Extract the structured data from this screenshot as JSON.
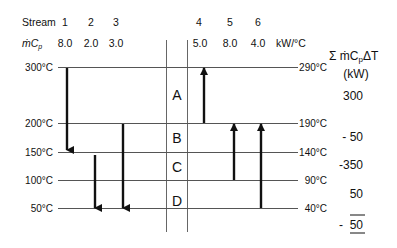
{
  "header": {
    "stream_label": "Stream",
    "mcp_label": "ṁC",
    "mcp_sub": "p",
    "units": "kW/°C",
    "streams": [
      {
        "id": "1",
        "mcp": "8.0"
      },
      {
        "id": "2",
        "mcp": "2.0"
      },
      {
        "id": "3",
        "mcp": "3.0"
      },
      {
        "id": "4",
        "mcp": "5.0"
      },
      {
        "id": "5",
        "mcp": "8.0"
      },
      {
        "id": "6",
        "mcp": "4.0"
      }
    ]
  },
  "hot_temps": [
    "300°C",
    "200°C",
    "150°C",
    "100°C",
    "50°C"
  ],
  "cold_temps": [
    "290°C",
    "190°C",
    "140°C",
    "90°C",
    "40°C"
  ],
  "intervals": [
    "A",
    "B",
    "C",
    "D"
  ],
  "sum_header": {
    "line1": "Σ ṁC",
    "sub": "p",
    "tail": "ΔT",
    "line2": "(kW)"
  },
  "interval_sums": [
    "300",
    "- 50",
    "-350",
    "50"
  ],
  "total": {
    "sign": "-",
    "value": "50"
  },
  "colors": {
    "line": "#555555",
    "arrow": "#111111"
  }
}
